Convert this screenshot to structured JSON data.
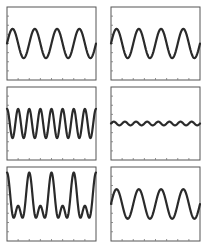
{
  "chart_data": [
    {
      "type": "line",
      "title": "",
      "xlabel": "",
      "ylabel": "",
      "position": "row-1-left",
      "function": "sine",
      "cycles": 4,
      "amplitude": 0.4,
      "offset": 0.0,
      "phase": 0.0,
      "xlim": [
        0,
        1
      ],
      "ylim": [
        -1,
        1
      ],
      "x_ticks": 8,
      "y_ticks": 8
    },
    {
      "type": "line",
      "title": "",
      "xlabel": "",
      "ylabel": "",
      "position": "row-1-right",
      "function": "sine",
      "cycles": 4,
      "amplitude": 0.4,
      "offset": 0.0,
      "phase": 0.0,
      "xlim": [
        0,
        1
      ],
      "ylim": [
        -1,
        1
      ],
      "x_ticks": 8,
      "y_ticks": 8
    },
    {
      "type": "line",
      "title": "",
      "xlabel": "",
      "ylabel": "",
      "position": "row-2-left",
      "function": "sine",
      "cycles": 8,
      "amplitude": 0.4,
      "offset": 0.0,
      "phase": 0.25,
      "xlim": [
        0,
        1
      ],
      "ylim": [
        -1,
        1
      ],
      "x_ticks": 8,
      "y_ticks": 8
    },
    {
      "type": "line",
      "title": "",
      "xlabel": "",
      "ylabel": "",
      "position": "row-2-right",
      "function": "sine",
      "cycles": 8,
      "amplitude": 0.05,
      "offset": 0.0,
      "phase": 0.0,
      "xlim": [
        0,
        1
      ],
      "ylim": [
        -1,
        1
      ],
      "x_ticks": 8,
      "y_ticks": 8
    },
    {
      "type": "line",
      "title": "",
      "xlabel": "",
      "ylabel": "",
      "position": "row-3-left",
      "function": "sum-of-sines",
      "components": [
        {
          "cycles": 4,
          "amplitude": 0.45,
          "phase": 0.25
        },
        {
          "cycles": 8,
          "amplitude": 0.35,
          "phase": 0.25
        }
      ],
      "offset": 0.05,
      "xlim": [
        0,
        1
      ],
      "ylim": [
        -1,
        1
      ],
      "x_ticks": 8,
      "y_ticks": 8
    },
    {
      "type": "line",
      "title": "",
      "xlabel": "",
      "ylabel": "",
      "position": "row-3-right",
      "function": "sine",
      "cycles": 4,
      "amplitude": 0.4,
      "offset": 0.0,
      "phase": 0.0,
      "xlim": [
        0,
        1
      ],
      "ylim": [
        -1,
        1
      ],
      "x_ticks": 8,
      "y_ticks": 8
    }
  ]
}
